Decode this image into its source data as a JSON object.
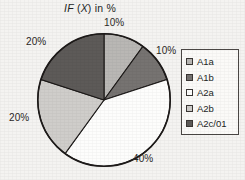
{
  "chart_data": {
    "type": "pie",
    "title_parts": {
      "prefix_italic": "IF",
      "variable_italic": "X",
      "suffix": "in %"
    },
    "xlabel": "",
    "ylabel": "",
    "grid": false,
    "legend_position": "right",
    "categories": [
      "A1a",
      "A1b",
      "A2a",
      "A2b",
      "A2c/01"
    ],
    "values": [
      10,
      10,
      40,
      20,
      20
    ],
    "value_labels": [
      "10%",
      "10%",
      "40%",
      "20%",
      "20%"
    ],
    "unit": "%",
    "colors": [
      "#b9b7b4",
      "#767371",
      "#fdfdfc",
      "#cfcdca",
      "#5d5a58"
    ],
    "slices": [
      {
        "label": "A1a",
        "value": 10,
        "value_label": "10%",
        "color": "#b9b7b4",
        "start_angle": 0,
        "end_angle": 36
      },
      {
        "label": "A1b",
        "value": 10,
        "value_label": "10%",
        "color": "#767371",
        "start_angle": 36,
        "end_angle": 72
      },
      {
        "label": "A2a",
        "value": 40,
        "value_label": "40%",
        "color": "#fdfdfc",
        "start_angle": 72,
        "end_angle": 216
      },
      {
        "label": "A2b",
        "value": 20,
        "value_label": "20%",
        "color": "#cfcdca",
        "start_angle": 216,
        "end_angle": 288
      },
      {
        "label": "A2c/01",
        "value": 20,
        "value_label": "20%",
        "color": "#5d5a58",
        "start_angle": 288,
        "end_angle": 360
      }
    ]
  },
  "legend": {
    "items": [
      {
        "label": "A1a",
        "color": "#b9b7b4"
      },
      {
        "label": "A1b",
        "color": "#767371"
      },
      {
        "label": "A2a",
        "color": "#fdfdfc"
      },
      {
        "label": "A2b",
        "color": "#cfcdca"
      },
      {
        "label": "A2c/01",
        "color": "#5d5a58"
      }
    ]
  },
  "style": {
    "outline_color": "#1d1a19",
    "background": "#f4f3f1",
    "text_color": "#231f1e"
  }
}
